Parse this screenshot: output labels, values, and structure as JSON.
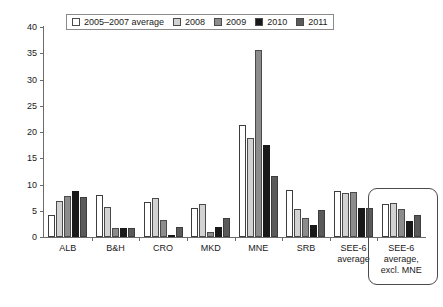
{
  "chart_data": {
    "type": "bar",
    "title": "",
    "xlabel": "",
    "ylabel": "",
    "ylim": [
      0,
      40
    ],
    "yticks": [
      0,
      5,
      10,
      15,
      20,
      25,
      30,
      35,
      40
    ],
    "grid": false,
    "legend_position": "top",
    "categories": [
      "ALB",
      "B&H",
      "CRO",
      "MKD",
      "MNE",
      "SRB",
      "SEE-6 average",
      "SEE-6 average, excl. MNE"
    ],
    "category_labels": [
      [
        "ALB"
      ],
      [
        "B&H"
      ],
      [
        "CRO"
      ],
      [
        "MKD"
      ],
      [
        "MNE"
      ],
      [
        "SRB"
      ],
      [
        "SEE-6",
        "average"
      ],
      [
        "SEE-6",
        "average,",
        "excl. MNE"
      ]
    ],
    "series": [
      {
        "name": "2005–2007 average",
        "color": "#ffffff",
        "values": [
          4.2,
          8.0,
          6.7,
          5.6,
          21.3,
          9.0,
          8.8,
          6.3
        ]
      },
      {
        "name": "2008",
        "color": "#d2d2d2",
        "values": [
          6.8,
          5.8,
          7.5,
          6.2,
          18.8,
          5.4,
          8.3,
          6.5
        ]
      },
      {
        "name": "2009",
        "color": "#8c8c8c",
        "values": [
          7.9,
          1.8,
          3.3,
          1.0,
          35.7,
          3.6,
          8.6,
          5.3
        ]
      },
      {
        "name": "2010",
        "color": "#191919",
        "values": [
          8.7,
          1.7,
          0.2,
          1.9,
          17.6,
          2.2,
          5.6,
          3.1
        ]
      },
      {
        "name": "2011",
        "color": "#5a5a5a",
        "values": [
          7.6,
          1.8,
          1.9,
          3.7,
          11.6,
          5.2,
          5.5,
          4.2
        ]
      }
    ],
    "annotations": [
      {
        "name": "highlight-box",
        "target_category": "SEE-6 average, excl. MNE",
        "shape": "rounded-rectangle"
      }
    ]
  }
}
